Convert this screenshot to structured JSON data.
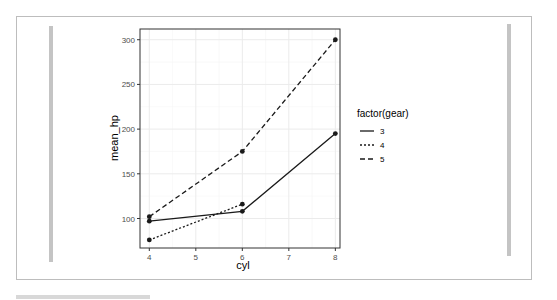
{
  "figure": {
    "caption_note": "caption text below the frame is clipped and not legible"
  },
  "chart_data": {
    "type": "line",
    "title": "",
    "xlabel": "cyl",
    "ylabel": "mean_hp",
    "x_ticks": [
      4,
      5,
      6,
      7,
      8
    ],
    "y_ticks": [
      100,
      150,
      200,
      250,
      300
    ],
    "xlim": [
      3.8,
      8.1
    ],
    "ylim": [
      67,
      312
    ],
    "grid": true,
    "legend": {
      "title": "factor(gear)",
      "position": "right",
      "entries": [
        {
          "label": "3",
          "linestyle": "solid"
        },
        {
          "label": "4",
          "linestyle": "dotted"
        },
        {
          "label": "5",
          "linestyle": "dashed"
        }
      ]
    },
    "series": [
      {
        "name": "3",
        "linestyle": "solid",
        "x": [
          4,
          6,
          8
        ],
        "values": [
          97,
          108,
          195
        ]
      },
      {
        "name": "4",
        "linestyle": "dotted",
        "x": [
          4,
          6
        ],
        "values": [
          76,
          116
        ]
      },
      {
        "name": "5",
        "linestyle": "dashed",
        "x": [
          4,
          6,
          8
        ],
        "values": [
          102,
          175,
          300
        ]
      }
    ],
    "colors": {
      "line": "#1a1a1a",
      "panel_border": "#333333",
      "grid_major": "#ebebeb",
      "grid_minor": "#f5f5f5",
      "axis_text": "#4d4d4d"
    }
  }
}
